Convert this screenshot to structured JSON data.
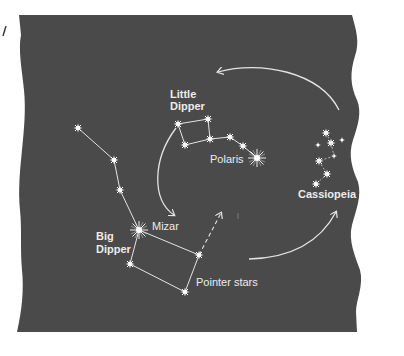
{
  "colors": {
    "background": "#ffffff",
    "sky": "#4a4a4a",
    "line": "#e4e4e4",
    "star": "#ffffff"
  },
  "labels": {
    "little_dipper_line1": "Little",
    "little_dipper_line2": "Dipper",
    "polaris": "Polaris",
    "cassiopeia": "Cassiopeia",
    "big_dipper_line1": "Big",
    "big_dipper_line2": "Dipper",
    "mizar": "Mizar",
    "pointer_stars": "Pointer stars"
  },
  "icons": {
    "star": "star-icon",
    "bright_star": "bright-star-icon",
    "rotation_arrow": "curved-arrow-icon",
    "pointer_arrow": "dashed-arrow-icon"
  }
}
